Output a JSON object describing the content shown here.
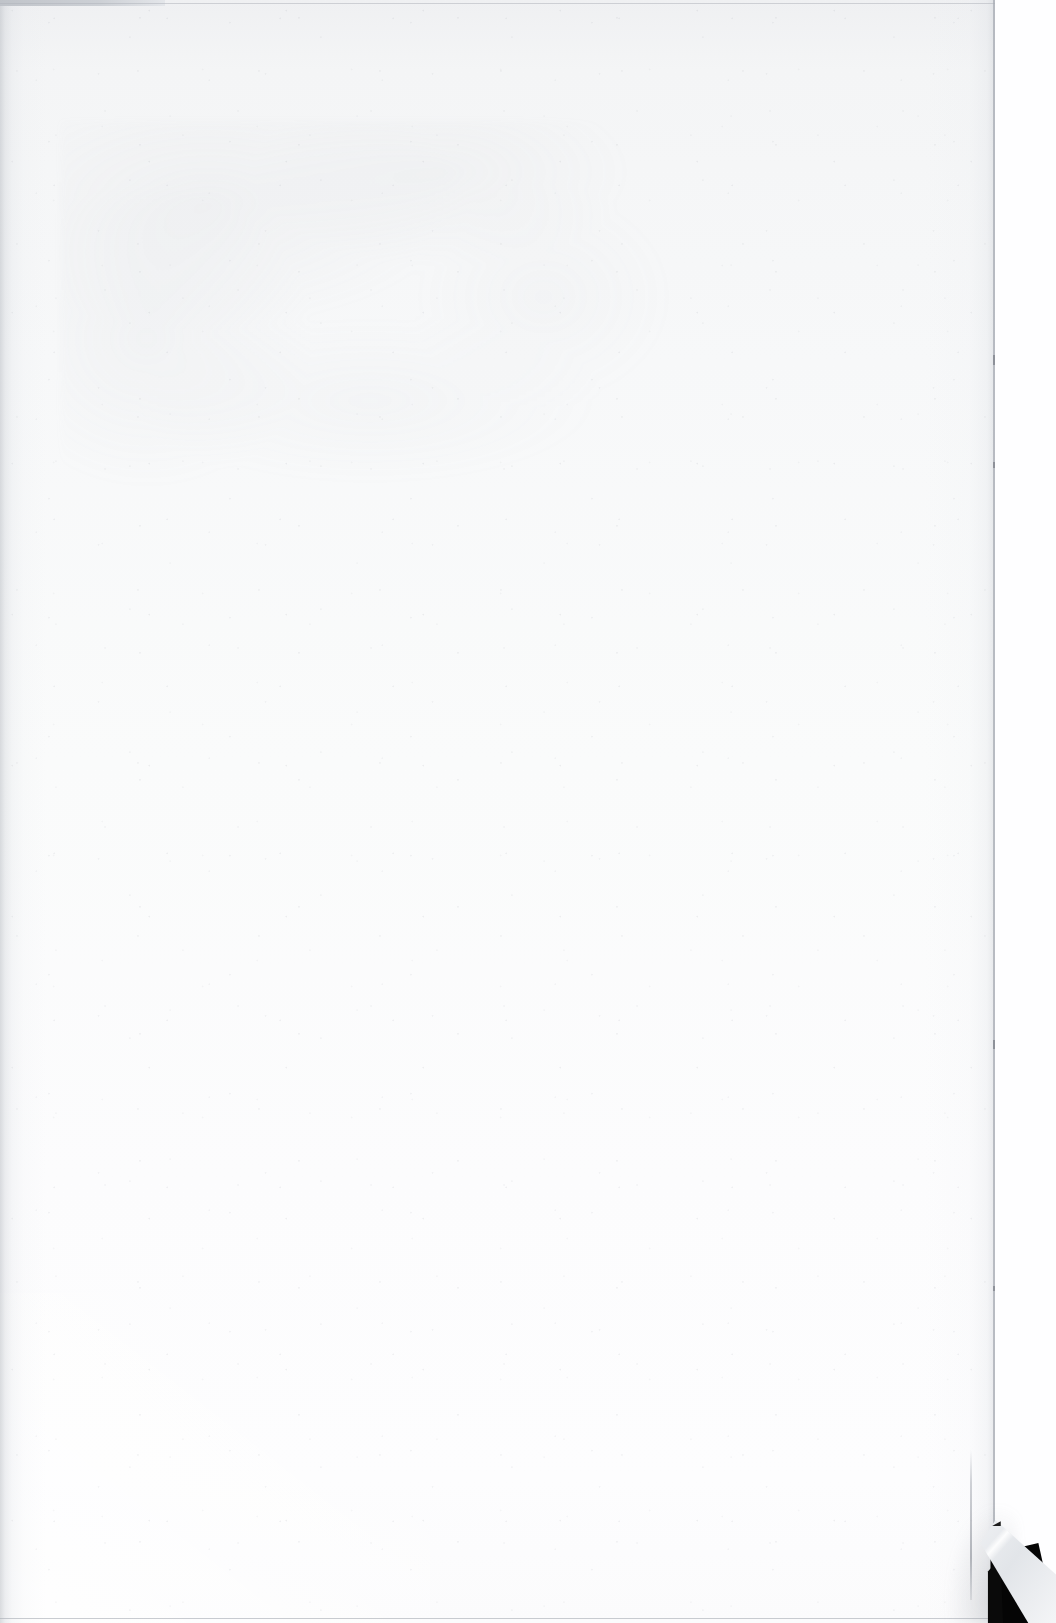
{
  "document": {
    "kind": "scanned-page",
    "page_state": "blank",
    "visible_text": "",
    "note": ""
  },
  "scan": {
    "width_px": 1056,
    "height_px": 1623,
    "background_color": "#fefeff"
  },
  "sheet": {
    "left_px": 0,
    "top_px": 0,
    "width_px": 995,
    "height_px": 1623,
    "paper_color": "#f8f9fa",
    "paper_color_top": "#eff0f2",
    "paper_color_bottom": "#fdfdfe"
  },
  "edges": {
    "top_rule_y_px": 3,
    "bottom_rule_y_px": 1618,
    "right_rule_x_px": 993,
    "rule_color": "#a4a8b0",
    "top_left_strip": {
      "width_px": 165,
      "height_px": 6,
      "color": "#bec2c8"
    }
  },
  "artifacts": {
    "gutter_shadow": {
      "side": "left",
      "width_px": 46,
      "color": "#babec4"
    },
    "dog_ear": {
      "corner": "bottom-right",
      "left_px": 930,
      "top_px": 1480,
      "width_px": 126,
      "height_px": 143,
      "void_color": "#050505",
      "flap_color": "#eceef1"
    },
    "show_through": {
      "region": "upper-left",
      "opacity": 0.5,
      "color": "#aaaeb6"
    },
    "speckle_color": "#969aa2"
  }
}
